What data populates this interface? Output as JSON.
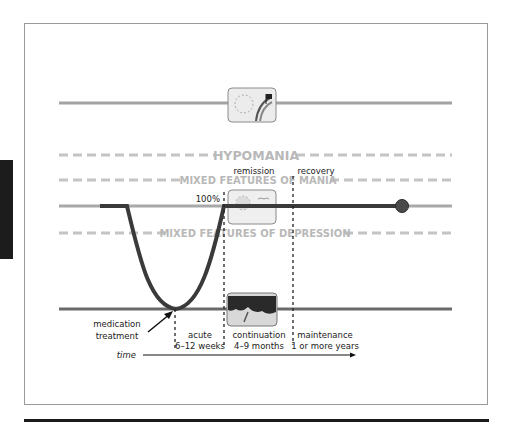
{
  "bands": {
    "hypomania": "HYPOMANIA",
    "mixed_mania": "MIXED FEATURES OF MANIA",
    "mixed_depression": "MIXED FEATURES OF DEPRESSION"
  },
  "phase_markers": {
    "remission": "remission",
    "recovery": "recovery",
    "hundred_percent": "100%"
  },
  "phases": [
    {
      "name": "acute",
      "duration": "6–12 weeks"
    },
    {
      "name": "continuation",
      "duration": "4–9 months"
    },
    {
      "name": "maintenance",
      "duration": "1 or more years"
    }
  ],
  "annotation": {
    "line1": "medication",
    "line2": "treatment"
  },
  "axis": {
    "time_label": "time"
  },
  "icons": {
    "top": "mania-icon",
    "middle": "euthymia-icon",
    "bottom": "depression-icon"
  },
  "colors": {
    "mood_line": "#3a3a3a",
    "baseline_gray": "#9e9e9e",
    "dash_gray": "#c4c4c4",
    "band_text": "#b8b8b8",
    "depression_line": "#5a5a5a"
  }
}
